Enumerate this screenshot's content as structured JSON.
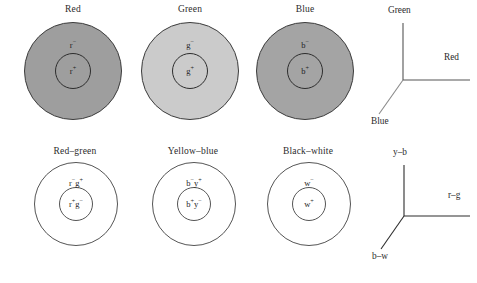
{
  "figure": {
    "background_color": "#ffffff",
    "outline_color": "#3c3c3c",
    "axis_color": "#555555",
    "text_color": "#262626"
  },
  "cone_row": {
    "panels": [
      {
        "title": "Red",
        "fill_color": "#9e9e9e",
        "outer_label": "r",
        "outer_sign": "−",
        "inner_label": "r",
        "inner_sign": "+"
      },
      {
        "title": "Green",
        "fill_color": "#cbcbcb",
        "outer_label": "g",
        "outer_sign": "−",
        "inner_label": "g",
        "inner_sign": "+"
      },
      {
        "title": "Blue",
        "fill_color": "#a4a4a4",
        "outer_label": "b",
        "outer_sign": "−",
        "inner_label": "b",
        "inner_sign": "+"
      }
    ],
    "axes": {
      "vertical_label": "Green",
      "horizontal_label": "Red",
      "diagonal_label": "Blue"
    }
  },
  "opponent_row": {
    "panels": [
      {
        "title": "Red–green",
        "fill_color": "#ffffff",
        "outer_first": "r",
        "outer_first_sign": "−",
        "outer_second": "g",
        "outer_second_sign": "+",
        "inner_first": "r",
        "inner_first_sign": "+",
        "inner_second": "g",
        "inner_second_sign": "−"
      },
      {
        "title": "Yellow–blue",
        "fill_color": "#ffffff",
        "outer_first": "b",
        "outer_first_sign": "−",
        "outer_second": "y",
        "outer_second_sign": "+",
        "inner_first": "b",
        "inner_first_sign": "+",
        "inner_second": "y",
        "inner_second_sign": "−"
      },
      {
        "title": "Black–white",
        "fill_color": "#ffffff",
        "outer_first": "w",
        "outer_first_sign": "−",
        "outer_second": "",
        "outer_second_sign": "",
        "inner_first": "w",
        "inner_first_sign": "+",
        "inner_second": "",
        "inner_second_sign": ""
      }
    ],
    "axes": {
      "vertical_label": "y–b",
      "horizontal_label": "r–g",
      "diagonal_label": "b–w"
    }
  }
}
